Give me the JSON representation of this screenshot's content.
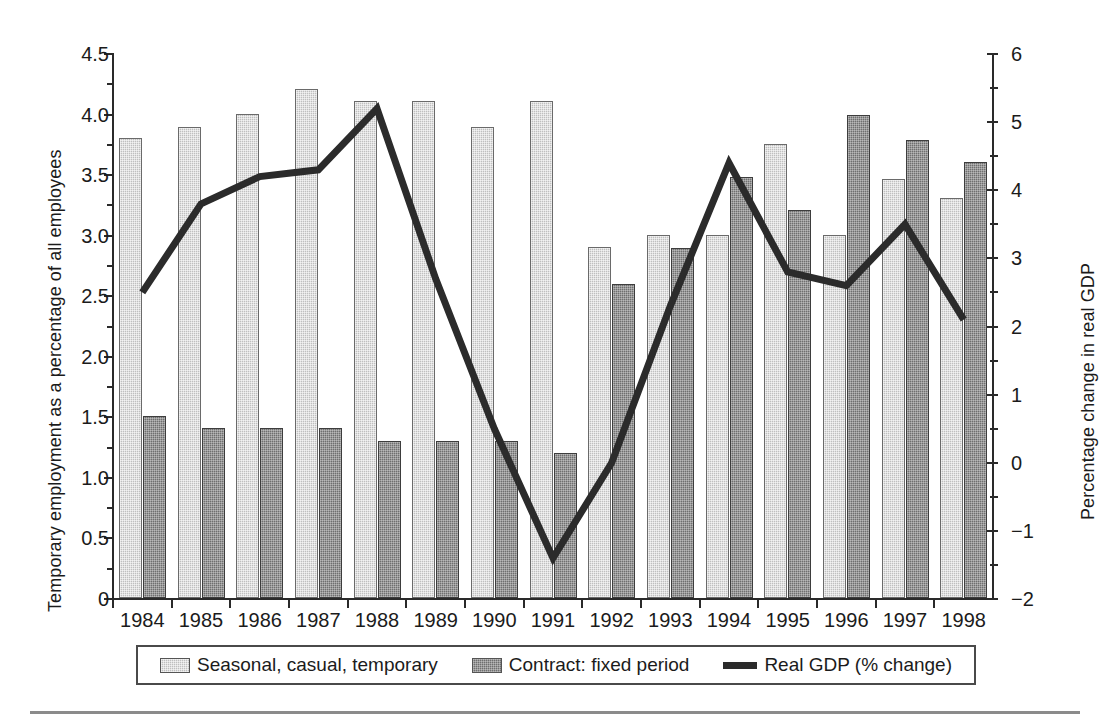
{
  "chart_data": {
    "type": "bar",
    "title": "",
    "xlabel": "",
    "ylabel": "Temporary employment as a percentage of all employees",
    "y2label": "Percentage change in real GDP",
    "categories": [
      "1984",
      "1985",
      "1986",
      "1987",
      "1988",
      "1989",
      "1990",
      "1991",
      "1992",
      "1993",
      "1994",
      "1995",
      "1996",
      "1997",
      "1998"
    ],
    "ylim": [
      0,
      4.5
    ],
    "y2lim": [
      -2,
      6
    ],
    "yticks": [
      "0",
      "0.5",
      "1.0",
      "1.5",
      "2.0",
      "2.5",
      "3.0",
      "3.5",
      "4.0",
      "4.5"
    ],
    "ytick_values": [
      0,
      0.5,
      1.0,
      1.5,
      2.0,
      2.5,
      3.0,
      3.5,
      4.0,
      4.5
    ],
    "y2ticks": [
      "−2",
      "−1",
      "0",
      "1",
      "2",
      "3",
      "4",
      "5",
      "6"
    ],
    "y2tick_values": [
      -2,
      -1,
      0,
      1,
      2,
      3,
      4,
      5,
      6
    ],
    "grid": false,
    "legend_position": "bottom",
    "series": [
      {
        "name": "Seasonal, casual, temporary",
        "type": "bar",
        "axis": "left",
        "color": "#bfbfbf",
        "values": [
          3.8,
          3.89,
          4.0,
          4.2,
          4.1,
          4.1,
          3.89,
          4.1,
          2.9,
          3.0,
          3.0,
          3.75,
          3.0,
          3.46,
          3.3
        ]
      },
      {
        "name": "Contract: fixed period",
        "type": "bar",
        "axis": "left",
        "color": "#6f6f6f",
        "values": [
          1.5,
          1.4,
          1.4,
          1.4,
          1.3,
          1.3,
          1.3,
          1.2,
          2.59,
          2.89,
          3.48,
          3.2,
          3.99,
          3.78,
          3.6
        ]
      },
      {
        "name": "Real GDP (% change)",
        "type": "line",
        "axis": "right",
        "color": "#2b2b2b",
        "values": [
          2.5,
          3.8,
          4.2,
          4.3,
          5.2,
          2.7,
          0.5,
          -1.4,
          0.0,
          2.3,
          4.4,
          2.8,
          2.6,
          3.5,
          2.1
        ]
      }
    ]
  },
  "legend": {
    "items": [
      {
        "label": "Seasonal, casual, temporary",
        "swatch": "light-hatch-swatch"
      },
      {
        "label": "Contract: fixed period",
        "swatch": "dark-hatch-swatch"
      },
      {
        "label": "Real GDP (% change)",
        "swatch": "line-swatch"
      }
    ]
  }
}
